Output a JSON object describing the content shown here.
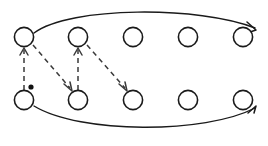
{
  "diagram": {
    "canvas": {
      "width": 268,
      "height": 146,
      "background": "#ffffff"
    },
    "style": {
      "node_stroke": "#1a1a1a",
      "node_fill": "#ffffff",
      "node_radius": 9.6,
      "node_stroke_width": 1.6,
      "solid_edge_color": "#1a1a1a",
      "dashed_edge_color": "#3a3a3a",
      "dash_pattern": "5 4",
      "token_color": "#111111"
    },
    "rows": [
      {
        "name": "top-row",
        "y": 37,
        "nodes": [
          {
            "id": "t1",
            "label": "",
            "cx": 24,
            "cy": 37,
            "r": 9.6
          },
          {
            "id": "t2",
            "label": "",
            "cx": 78,
            "cy": 37,
            "r": 9.6
          },
          {
            "id": "t3",
            "label": "",
            "cx": 133,
            "cy": 37,
            "r": 9.6
          },
          {
            "id": "t4",
            "label": "",
            "cx": 188,
            "cy": 37,
            "r": 9.6
          },
          {
            "id": "t5",
            "label": "",
            "cx": 243,
            "cy": 37,
            "r": 9.6
          }
        ]
      },
      {
        "name": "bottom-row",
        "y": 100,
        "nodes": [
          {
            "id": "b1",
            "label": "",
            "cx": 24,
            "cy": 100,
            "r": 9.6
          },
          {
            "id": "b2",
            "label": "",
            "cx": 78,
            "cy": 100,
            "r": 9.6
          },
          {
            "id": "b3",
            "label": "",
            "cx": 133,
            "cy": 100,
            "r": 9.6
          },
          {
            "id": "b4",
            "label": "",
            "cx": 188,
            "cy": 100,
            "r": 9.6
          },
          {
            "id": "b5",
            "label": "",
            "cx": 243,
            "cy": 100,
            "r": 9.6
          }
        ]
      }
    ],
    "tokens": [
      {
        "id": "token-b1",
        "on_node": "b1",
        "cx": 31,
        "cy": 87,
        "r": 2.6
      }
    ],
    "dashed_edges": [
      {
        "id": "d-b1-t1",
        "from": "b1",
        "to": "t1",
        "kind": "vertical-up",
        "x1": 24,
        "y1": 90,
        "x2": 24,
        "y2": 48
      },
      {
        "id": "d-b2-t2",
        "from": "b2",
        "to": "t2",
        "kind": "vertical-up",
        "x1": 78,
        "y1": 90,
        "x2": 78,
        "y2": 48
      },
      {
        "id": "d-t1-b2",
        "from": "t1",
        "to": "b2",
        "kind": "diagonal-down-right",
        "x1": 33,
        "y1": 45,
        "x2": 71,
        "y2": 90
      },
      {
        "id": "d-t2-b3",
        "from": "t2",
        "to": "b3",
        "kind": "diagonal-down-right",
        "x1": 87,
        "y1": 45,
        "x2": 126,
        "y2": 90
      }
    ],
    "solid_edges": [
      {
        "id": "s-t1-t5",
        "from": "t1",
        "to": "t5",
        "kind": "curve-over-top",
        "path": "M 34 33 C 70 6, 200 6, 255 28",
        "arrow_at": {
          "x": 256,
          "y": 30,
          "direction": "down-right"
        }
      },
      {
        "id": "s-b1-b5",
        "from": "b1",
        "to": "b5",
        "kind": "curve-under-bottom",
        "path": "M 34 106 C 80 134, 205 134, 255 108",
        "arrow_at": {
          "x": 256,
          "y": 106,
          "direction": "up-right"
        }
      }
    ],
    "counts": {
      "nodes_total": 10,
      "columns": 5,
      "rows": 2,
      "tokens": 1,
      "dashed_arrows": 4,
      "solid_arrows": 2
    }
  }
}
